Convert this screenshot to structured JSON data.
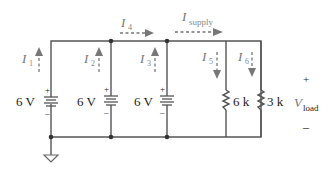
{
  "diagram": {
    "type": "circuit-schematic",
    "sources": [
      {
        "id": "V1",
        "label": "6 V",
        "plus": "+",
        "minus": "–"
      },
      {
        "id": "V2",
        "label": "6 V",
        "plus": "+",
        "minus": "–"
      },
      {
        "id": "V3",
        "label": "6 V",
        "plus": "+",
        "minus": "–"
      }
    ],
    "resistors": [
      {
        "id": "R1",
        "label": "6 k"
      },
      {
        "id": "R2",
        "label": "3 k"
      }
    ],
    "currents": [
      {
        "id": "I1",
        "main": "I",
        "sub": "1",
        "direction": "up"
      },
      {
        "id": "I2",
        "main": "I",
        "sub": "2",
        "direction": "up"
      },
      {
        "id": "I3",
        "main": "I",
        "sub": "3",
        "direction": "up"
      },
      {
        "id": "I4",
        "main": "I",
        "sub": "4",
        "direction": "right"
      },
      {
        "id": "Isupply",
        "main": "I",
        "sub": "supply",
        "direction": "right"
      },
      {
        "id": "I5",
        "main": "I",
        "sub": "5",
        "direction": "down"
      },
      {
        "id": "I6",
        "main": "I",
        "sub": "6",
        "direction": "down"
      }
    ],
    "load_voltage": {
      "main": "V",
      "sub": "load",
      "plus": "+",
      "minus": "–"
    },
    "ground": "ground-symbol"
  }
}
